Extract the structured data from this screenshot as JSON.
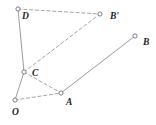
{
  "figure": {
    "width": 156,
    "height": 125,
    "background_color": "#ffffff",
    "stroke_color": "#8e8e96",
    "label_color": "#1b1b1f",
    "vertices": [
      {
        "id": "D",
        "label": "D",
        "x": 18,
        "y": 9,
        "label_x": 22,
        "label_y": 12
      },
      {
        "id": "Bp",
        "label": "B'",
        "x": 100,
        "y": 14,
        "label_x": 110,
        "label_y": 12
      },
      {
        "id": "B",
        "label": "B",
        "x": 135,
        "y": 36,
        "label_x": 143,
        "label_y": 38
      },
      {
        "id": "C",
        "label": "C",
        "x": 24,
        "y": 72,
        "label_x": 32,
        "label_y": 69
      },
      {
        "id": "A",
        "label": "A",
        "x": 61,
        "y": 93,
        "label_x": 66,
        "label_y": 98
      },
      {
        "id": "O",
        "label": "O",
        "x": 15,
        "y": 100,
        "label_x": 12,
        "label_y": 108
      }
    ],
    "segments": [
      {
        "id": "D-C",
        "from": "D",
        "to": "C",
        "style": "solid"
      },
      {
        "id": "C-O",
        "from": "C",
        "to": "O",
        "style": "solid"
      },
      {
        "id": "A-B",
        "from": "A",
        "to": "B",
        "style": "solid"
      },
      {
        "id": "D-Bp",
        "from": "D",
        "to": "Bp",
        "style": "dashed"
      },
      {
        "id": "C-Bp",
        "from": "C",
        "to": "Bp",
        "style": "dashed"
      },
      {
        "id": "C-A",
        "from": "C",
        "to": "A",
        "style": "dashed"
      },
      {
        "id": "O-A",
        "from": "O",
        "to": "A",
        "style": "dashed"
      }
    ]
  }
}
